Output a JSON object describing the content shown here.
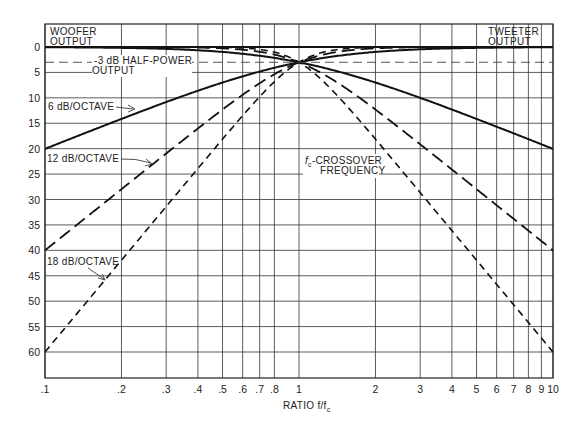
{
  "chart_data": {
    "type": "line",
    "title": "",
    "xlabel": "RATIO f/f",
    "xlabel_sub": "c",
    "ylabel": "",
    "xscale": "log",
    "xlim": [
      0.1,
      10
    ],
    "ylim": [
      65,
      -5
    ],
    "y_inverted": true,
    "grid": true,
    "x_ticks": [
      0.1,
      0.2,
      0.3,
      0.4,
      0.5,
      0.6,
      0.7,
      0.8,
      1,
      2,
      3,
      4,
      5,
      6,
      7,
      8,
      9,
      10
    ],
    "x_tick_labels": [
      ".1",
      ".2",
      ".3",
      ".4",
      ".5",
      ".6",
      ".7",
      ".8",
      "1",
      "2",
      "3",
      "4",
      "5",
      "6",
      "7",
      "8",
      "9",
      "10"
    ],
    "y_ticks": [
      0,
      5,
      10,
      15,
      20,
      25,
      30,
      35,
      40,
      45,
      50,
      55,
      60
    ],
    "y_tick_labels": [
      "0",
      "5",
      "10",
      "15",
      "20",
      "25",
      "30",
      "35",
      "40",
      "45",
      "50",
      "55",
      "60"
    ],
    "series": [
      {
        "name": "6 dB/OCTAVE woofer",
        "style": "solid",
        "x": [
          0.1,
          0.2,
          0.5,
          1,
          2,
          5,
          10
        ],
        "y": [
          20.04,
          14.04,
          6.9,
          3.0,
          0.97,
          0.17,
          0.04
        ]
      },
      {
        "name": "6 dB/OCTAVE tweeter",
        "style": "solid",
        "x": [
          0.1,
          0.2,
          0.5,
          1,
          2,
          5,
          10
        ],
        "y": [
          0.04,
          0.17,
          0.97,
          3.0,
          6.9,
          14.04,
          20.04
        ]
      },
      {
        "name": "12 dB/OCTAVE woofer",
        "style": "long-dash",
        "x": [
          0.1,
          0.2,
          0.5,
          1,
          2,
          5,
          10
        ],
        "y": [
          40.0,
          27.96,
          12.3,
          3.0,
          0.26,
          0.0,
          0.0
        ]
      },
      {
        "name": "12 dB/OCTAVE tweeter",
        "style": "long-dash",
        "x": [
          0.1,
          0.2,
          0.5,
          1,
          2,
          5,
          10
        ],
        "y": [
          0.0,
          0.0,
          0.26,
          3.0,
          12.3,
          27.96,
          40.0
        ]
      },
      {
        "name": "18 dB/OCTAVE woofer",
        "style": "short-dash",
        "x": [
          0.1,
          0.2,
          0.5,
          1,
          2,
          5,
          10
        ],
        "y": [
          60.0,
          41.9,
          18.1,
          3.0,
          0.07,
          0.0,
          0.0
        ]
      },
      {
        "name": "18 dB/OCTAVE tweeter",
        "style": "short-dash",
        "x": [
          0.1,
          0.2,
          0.5,
          1,
          2,
          5,
          10
        ],
        "y": [
          0.0,
          0.0,
          0.07,
          3.0,
          18.1,
          41.9,
          60.0
        ]
      },
      {
        "name": "-3 dB HALF-POWER OUTPUT",
        "style": "thin-dash",
        "x": [
          0.1,
          10
        ],
        "y": [
          3,
          3
        ]
      }
    ],
    "annotations": {
      "woofer": [
        "WOOFER",
        "OUTPUT"
      ],
      "tweeter": [
        "TWEETER",
        "OUTPUT"
      ],
      "half_power": [
        "-3 dB HALF-POWER",
        "OUTPUT"
      ],
      "six_db": "6 dB/OCTAVE",
      "twelve_db": "12 dB/OCTAVE",
      "eighteen_db": "18 dB/OCTAVE",
      "crossover": [
        "-CROSSOVER",
        "FREQUENCY"
      ],
      "crossover_sym": "f",
      "crossover_sub": "c"
    }
  }
}
